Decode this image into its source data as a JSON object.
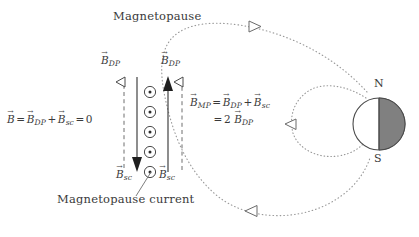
{
  "figure": {
    "width": 419,
    "height": 237,
    "background": "#ffffff",
    "ink_color": "#3a3a3a",
    "dotted_color": "#9a9a9a",
    "earth_shadow_color": "#808080"
  },
  "labels": {
    "magnetopause_title": "Magnetopause",
    "magnetopause_current": "Magnetopause current",
    "pole_north": "N",
    "pole_south": "S"
  },
  "vectors": {
    "b_dp_left": {
      "script": "B",
      "sub": "DP",
      "arrow_style": "hollow",
      "direction": "up"
    },
    "b_sc_left": {
      "script": "B",
      "sub": "sc",
      "arrow_style": "filled",
      "direction": "down"
    },
    "b_dp_right": {
      "script": "B",
      "sub": "DP",
      "arrow_style": "hollow",
      "direction": "up"
    },
    "b_sc_right": {
      "script": "B",
      "sub": "sc",
      "arrow_style": "filled",
      "direction": "up"
    }
  },
  "equations": {
    "inside": {
      "lhs": "B",
      "terms": [
        "B",
        "B"
      ],
      "subs": [
        "DP",
        "sc"
      ],
      "result": "0",
      "plain": "B = B_DP + B_sc = 0"
    },
    "outside": {
      "lhs": "B",
      "lhs_sub": "MP",
      "terms": [
        "B",
        "B"
      ],
      "subs": [
        "DP",
        "sc"
      ],
      "result_coefficient": "2",
      "result_sub": "DP",
      "plain": "B_MP = B_DP + B_sc = 2 B_DP"
    }
  },
  "current_sheet": {
    "symbol": "circle-dot",
    "meaning": "out-of-page",
    "count": 5
  },
  "flow_arrows": {
    "top_direction": "right",
    "bottom_direction": "left",
    "inner_loop_direction": "left"
  }
}
